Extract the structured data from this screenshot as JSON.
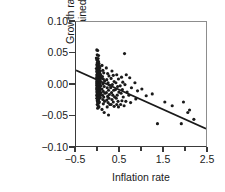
{
  "chart_data": {
    "type": "scatter",
    "title": "",
    "xlabel": "Inflation rate",
    "ylabel_line1": "Growth rate",
    "ylabel_line2": "(unexplained part)",
    "xlim": [
      -0.5,
      2.5
    ],
    "ylim": [
      -0.1,
      0.1
    ],
    "grid": false,
    "legend": null,
    "xticks": [
      -0.5,
      0.5,
      1.5,
      2.5
    ],
    "xticklabels": [
      "−0.5",
      "0.5",
      "1.5",
      "2.5"
    ],
    "xminorticks": [
      0.0,
      1.0,
      2.0
    ],
    "yticks": [
      0.1,
      0.05,
      0.0,
      -0.05,
      -0.1
    ],
    "yticklabels": [
      "0.10",
      "0.05",
      "0.00",
      "−0.05",
      "−0.10"
    ],
    "marker": "dot",
    "marker_color": "#1a1a1a",
    "marker_size": 1.6,
    "fit_line": {
      "label": "regression line",
      "color": "#1a1a1a",
      "width": 1.7,
      "x_start": -0.5,
      "y_start": 0.022,
      "x_end": 2.5,
      "y_end": -0.072,
      "slope": -0.03133,
      "intercept": 0.00633
    },
    "points": [
      [
        -0.02,
        0.055
      ],
      [
        0.0,
        0.054
      ],
      [
        -0.01,
        0.047
      ],
      [
        0.02,
        0.046
      ],
      [
        -0.03,
        0.042
      ],
      [
        0.01,
        0.041
      ],
      [
        -0.02,
        0.039
      ],
      [
        0.0,
        0.037
      ],
      [
        0.02,
        0.036
      ],
      [
        -0.01,
        0.034
      ],
      [
        0.03,
        0.033
      ],
      [
        0.0,
        0.032
      ],
      [
        -0.02,
        0.031
      ],
      [
        0.01,
        0.03
      ],
      [
        0.04,
        0.029
      ],
      [
        -0.01,
        0.028
      ],
      [
        0.02,
        0.027
      ],
      [
        0.0,
        0.026
      ],
      [
        0.05,
        0.026
      ],
      [
        -0.03,
        0.025
      ],
      [
        0.01,
        0.024
      ],
      [
        0.03,
        0.024
      ],
      [
        0.0,
        0.023
      ],
      [
        -0.01,
        0.022
      ],
      [
        0.02,
        0.022
      ],
      [
        0.06,
        0.021
      ],
      [
        0.0,
        0.021
      ],
      [
        -0.02,
        0.02
      ],
      [
        0.03,
        0.02
      ],
      [
        0.01,
        0.019
      ],
      [
        0.04,
        0.019
      ],
      [
        0.0,
        0.018
      ],
      [
        -0.01,
        0.018
      ],
      [
        0.02,
        0.017
      ],
      [
        0.05,
        0.017
      ],
      [
        0.0,
        0.016
      ],
      [
        0.03,
        0.016
      ],
      [
        -0.02,
        0.015
      ],
      [
        0.01,
        0.015
      ],
      [
        0.07,
        0.015
      ],
      [
        0.0,
        0.014
      ],
      [
        0.02,
        0.014
      ],
      [
        -0.01,
        0.013
      ],
      [
        0.04,
        0.013
      ],
      [
        0.0,
        0.012
      ],
      [
        0.03,
        0.012
      ],
      [
        0.01,
        0.011
      ],
      [
        -0.02,
        0.011
      ],
      [
        0.05,
        0.011
      ],
      [
        0.0,
        0.01
      ],
      [
        0.02,
        0.01
      ],
      [
        0.08,
        0.01
      ],
      [
        -0.01,
        0.009
      ],
      [
        0.03,
        0.009
      ],
      [
        0.0,
        0.009
      ],
      [
        0.01,
        0.008
      ],
      [
        0.04,
        0.008
      ],
      [
        -0.02,
        0.008
      ],
      [
        0.02,
        0.007
      ],
      [
        0.0,
        0.007
      ],
      [
        0.06,
        0.007
      ],
      [
        0.01,
        0.006
      ],
      [
        0.03,
        0.006
      ],
      [
        -0.01,
        0.006
      ],
      [
        0.0,
        0.005
      ],
      [
        0.02,
        0.005
      ],
      [
        0.05,
        0.005
      ],
      [
        -0.02,
        0.004
      ],
      [
        0.01,
        0.004
      ],
      [
        0.03,
        0.004
      ],
      [
        0.0,
        0.003
      ],
      [
        0.04,
        0.003
      ],
      [
        -0.01,
        0.003
      ],
      [
        0.02,
        0.002
      ],
      [
        0.0,
        0.002
      ],
      [
        0.06,
        0.002
      ],
      [
        0.01,
        0.001
      ],
      [
        0.03,
        0.001
      ],
      [
        -0.02,
        0.001
      ],
      [
        0.0,
        0.0
      ],
      [
        0.02,
        0.0
      ],
      [
        0.05,
        0.0
      ],
      [
        -0.01,
        -0.001
      ],
      [
        0.01,
        -0.001
      ],
      [
        0.03,
        -0.001
      ],
      [
        0.0,
        -0.002
      ],
      [
        0.04,
        -0.002
      ],
      [
        -0.02,
        -0.002
      ],
      [
        0.02,
        -0.003
      ],
      [
        0.0,
        -0.003
      ],
      [
        0.07,
        -0.003
      ],
      [
        0.01,
        -0.004
      ],
      [
        0.03,
        -0.004
      ],
      [
        -0.01,
        -0.004
      ],
      [
        0.0,
        -0.005
      ],
      [
        0.02,
        -0.005
      ],
      [
        0.05,
        -0.005
      ],
      [
        -0.02,
        -0.006
      ],
      [
        0.01,
        -0.006
      ],
      [
        0.04,
        -0.006
      ],
      [
        0.0,
        -0.007
      ],
      [
        0.03,
        -0.007
      ],
      [
        -0.01,
        -0.007
      ],
      [
        0.02,
        -0.008
      ],
      [
        0.0,
        -0.008
      ],
      [
        0.06,
        -0.008
      ],
      [
        0.01,
        -0.009
      ],
      [
        0.03,
        -0.009
      ],
      [
        -0.02,
        -0.009
      ],
      [
        0.0,
        -0.01
      ],
      [
        0.05,
        -0.01
      ],
      [
        0.02,
        -0.01
      ],
      [
        -0.01,
        -0.011
      ],
      [
        0.01,
        -0.011
      ],
      [
        0.04,
        -0.012
      ],
      [
        0.0,
        -0.012
      ],
      [
        0.03,
        -0.013
      ],
      [
        -0.02,
        -0.013
      ],
      [
        0.02,
        -0.014
      ],
      [
        0.0,
        -0.014
      ],
      [
        0.07,
        -0.014
      ],
      [
        0.01,
        -0.015
      ],
      [
        0.03,
        -0.015
      ],
      [
        -0.01,
        -0.016
      ],
      [
        0.0,
        -0.016
      ],
      [
        0.05,
        -0.017
      ],
      [
        0.02,
        -0.017
      ],
      [
        -0.02,
        -0.018
      ],
      [
        0.01,
        -0.018
      ],
      [
        0.04,
        -0.019
      ],
      [
        0.0,
        -0.019
      ],
      [
        0.03,
        -0.02
      ],
      [
        -0.01,
        -0.02
      ],
      [
        0.02,
        -0.021
      ],
      [
        0.0,
        -0.022
      ],
      [
        0.06,
        -0.022
      ],
      [
        0.01,
        -0.023
      ],
      [
        -0.02,
        -0.023
      ],
      [
        0.03,
        -0.024
      ],
      [
        0.0,
        -0.025
      ],
      [
        0.02,
        -0.026
      ],
      [
        -0.01,
        -0.027
      ],
      [
        0.01,
        -0.028
      ],
      [
        0.04,
        -0.029
      ],
      [
        0.0,
        -0.03
      ],
      [
        0.02,
        -0.031
      ],
      [
        -0.01,
        -0.033
      ],
      [
        0.01,
        -0.035
      ],
      [
        0.03,
        -0.037
      ],
      [
        0.0,
        -0.039
      ],
      [
        0.1,
        0.03
      ],
      [
        0.12,
        0.022
      ],
      [
        0.14,
        0.018
      ],
      [
        0.11,
        0.012
      ],
      [
        0.13,
        0.008
      ],
      [
        0.16,
        0.005
      ],
      [
        0.12,
        0.0
      ],
      [
        0.15,
        -0.004
      ],
      [
        0.1,
        -0.008
      ],
      [
        0.13,
        -0.012
      ],
      [
        0.17,
        -0.015
      ],
      [
        0.11,
        -0.018
      ],
      [
        0.14,
        -0.021
      ],
      [
        0.12,
        -0.025
      ],
      [
        0.16,
        -0.028
      ],
      [
        0.13,
        -0.032
      ],
      [
        0.1,
        -0.041
      ],
      [
        0.15,
        -0.046
      ],
      [
        0.2,
        0.026
      ],
      [
        0.23,
        0.017
      ],
      [
        0.26,
        0.013
      ],
      [
        0.21,
        0.007
      ],
      [
        0.24,
        0.002
      ],
      [
        0.28,
        -0.002
      ],
      [
        0.22,
        -0.006
      ],
      [
        0.25,
        -0.01
      ],
      [
        0.2,
        -0.014
      ],
      [
        0.27,
        -0.017
      ],
      [
        0.23,
        -0.02
      ],
      [
        0.26,
        -0.023
      ],
      [
        0.21,
        -0.026
      ],
      [
        0.24,
        -0.03
      ],
      [
        0.28,
        -0.033
      ],
      [
        0.22,
        -0.037
      ],
      [
        0.25,
        -0.05
      ],
      [
        0.33,
        0.021
      ],
      [
        0.36,
        0.014
      ],
      [
        0.31,
        0.009
      ],
      [
        0.38,
        0.004
      ],
      [
        0.34,
        -0.001
      ],
      [
        0.3,
        -0.006
      ],
      [
        0.37,
        -0.01
      ],
      [
        0.32,
        -0.014
      ],
      [
        0.35,
        -0.018
      ],
      [
        0.39,
        -0.021
      ],
      [
        0.33,
        -0.025
      ],
      [
        0.36,
        -0.029
      ],
      [
        0.31,
        -0.033
      ],
      [
        0.38,
        -0.036
      ],
      [
        0.44,
        0.015
      ],
      [
        0.48,
        0.008
      ],
      [
        0.42,
        0.002
      ],
      [
        0.46,
        -0.004
      ],
      [
        0.41,
        -0.009
      ],
      [
        0.49,
        -0.013
      ],
      [
        0.45,
        -0.018
      ],
      [
        0.43,
        -0.023
      ],
      [
        0.47,
        -0.028
      ],
      [
        0.44,
        -0.033
      ],
      [
        0.48,
        -0.037
      ],
      [
        0.55,
        0.011
      ],
      [
        0.58,
        0.003
      ],
      [
        0.52,
        -0.003
      ],
      [
        0.57,
        -0.009
      ],
      [
        0.54,
        -0.015
      ],
      [
        0.59,
        -0.021
      ],
      [
        0.56,
        -0.027
      ],
      [
        0.53,
        -0.033
      ],
      [
        0.62,
        0.049
      ],
      [
        0.66,
        0.015
      ],
      [
        0.63,
        -0.001
      ],
      [
        0.68,
        -0.013
      ],
      [
        0.65,
        -0.028
      ],
      [
        0.61,
        -0.035
      ],
      [
        0.74,
        0.01
      ],
      [
        0.78,
        -0.006
      ],
      [
        0.72,
        -0.018
      ],
      [
        0.76,
        -0.03
      ],
      [
        0.86,
        0.002
      ],
      [
        0.92,
        -0.011
      ],
      [
        0.88,
        -0.024
      ],
      [
        1.02,
        -0.008
      ],
      [
        1.12,
        -0.019
      ],
      [
        1.26,
        -0.016
      ],
      [
        1.38,
        -0.064
      ],
      [
        1.55,
        -0.029
      ],
      [
        1.72,
        -0.035
      ],
      [
        1.93,
        -0.064
      ],
      [
        1.98,
        -0.029
      ],
      [
        2.12,
        -0.042
      ],
      [
        2.22,
        -0.057
      ],
      [
        2.08,
        -0.046
      ]
    ]
  }
}
